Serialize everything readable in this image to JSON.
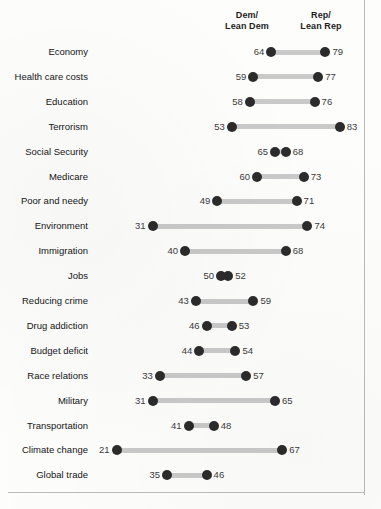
{
  "header": {
    "dem_line1": "Dem/",
    "dem_line2": "Lean Dem",
    "rep_line1": "Rep/",
    "rep_line2": "Lean Rep"
  },
  "colors": {
    "dot": "#2b2b2b",
    "connector": "#c9c9c9",
    "label_text": "#151515",
    "value_text": "#3a3a3a",
    "background": "#ffffff"
  },
  "chart_data": {
    "type": "scatter",
    "subtype": "dumbbell",
    "title": "",
    "subtitle": "",
    "xlabel": "",
    "ylabel": "",
    "xlim": [
      15,
      90
    ],
    "grid": false,
    "legend_position": "top",
    "series": [
      {
        "name": "Dem/Lean Dem",
        "values": [
          64,
          59,
          58,
          53,
          65,
          60,
          49,
          31,
          40,
          50,
          43,
          46,
          44,
          33,
          31,
          41,
          21,
          35
        ]
      },
      {
        "name": "Rep/Lean Rep",
        "values": [
          79,
          77,
          76,
          83,
          68,
          73,
          71,
          74,
          68,
          52,
          59,
          53,
          54,
          57,
          65,
          48,
          67,
          46
        ]
      }
    ],
    "categories": [
      "Economy",
      "Health care costs",
      "Education",
      "Terrorism",
      "Social Security",
      "Medicare",
      "Poor and needy",
      "Environment",
      "Immigration",
      "Jobs",
      "Reducing crime",
      "Drug addiction",
      "Budget deficit",
      "Race relations",
      "Military",
      "Transportation",
      "Climate change",
      "Global trade"
    ],
    "rows": [
      {
        "label": "Economy",
        "dem": 64,
        "rep": 79
      },
      {
        "label": "Health care costs",
        "dem": 59,
        "rep": 77
      },
      {
        "label": "Education",
        "dem": 58,
        "rep": 76
      },
      {
        "label": "Terrorism",
        "dem": 53,
        "rep": 83
      },
      {
        "label": "Social Security",
        "dem": 65,
        "rep": 68
      },
      {
        "label": "Medicare",
        "dem": 60,
        "rep": 73
      },
      {
        "label": "Poor and needy",
        "dem": 49,
        "rep": 71
      },
      {
        "label": "Environment",
        "dem": 31,
        "rep": 74
      },
      {
        "label": "Immigration",
        "dem": 40,
        "rep": 68
      },
      {
        "label": "Jobs",
        "dem": 50,
        "rep": 52
      },
      {
        "label": "Reducing crime",
        "dem": 43,
        "rep": 59
      },
      {
        "label": "Drug addiction",
        "dem": 46,
        "rep": 53
      },
      {
        "label": "Budget deficit",
        "dem": 44,
        "rep": 54
      },
      {
        "label": "Race relations",
        "dem": 33,
        "rep": 57
      },
      {
        "label": "Military",
        "dem": 31,
        "rep": 65
      },
      {
        "label": "Transportation",
        "dem": 41,
        "rep": 48
      },
      {
        "label": "Climate change",
        "dem": 21,
        "rep": 67
      },
      {
        "label": "Global trade",
        "dem": 35,
        "rep": 46
      }
    ]
  }
}
